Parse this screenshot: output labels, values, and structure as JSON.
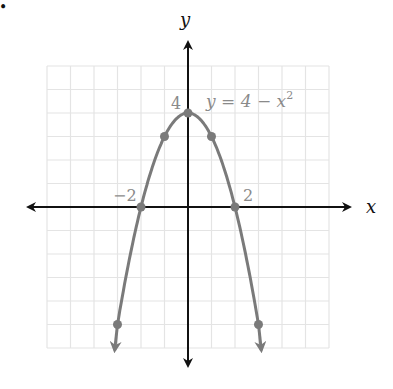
{
  "chart_data": {
    "type": "line",
    "title": "",
    "xlabel": "x",
    "ylabel": "y",
    "xlim": [
      -6,
      6
    ],
    "ylim": [
      -6,
      6
    ],
    "grid": true,
    "equation_label": "y = 4 − x²",
    "equation": "y = 4 - x^2",
    "series": [
      {
        "name": "y = 4 - x^2",
        "color": "#7a7a7a",
        "points": [
          {
            "x": -3,
            "y": -5
          },
          {
            "x": -2,
            "y": 0
          },
          {
            "x": -1,
            "y": 3
          },
          {
            "x": 0,
            "y": 4
          },
          {
            "x": 1,
            "y": 3
          },
          {
            "x": 2,
            "y": 0
          },
          {
            "x": 3,
            "y": -5
          }
        ]
      }
    ],
    "annotations": [
      {
        "text": "4",
        "x": 0,
        "y": 4
      },
      {
        "text": "−2",
        "x": -2,
        "y": 0
      },
      {
        "text": "2",
        "x": 2,
        "y": 0
      }
    ]
  },
  "labels": {
    "x_axis": "x",
    "y_axis": "y",
    "equation_main": "y = 4 − x",
    "equation_exp": "2",
    "tick_y4": "4",
    "tick_xneg2": "−2",
    "tick_x2": "2",
    "bullet": "•"
  },
  "colors": {
    "axis": "#111111",
    "curve": "#7a7a7a",
    "grid": "#e4e4e4",
    "label_gray": "#8a8a8a"
  }
}
